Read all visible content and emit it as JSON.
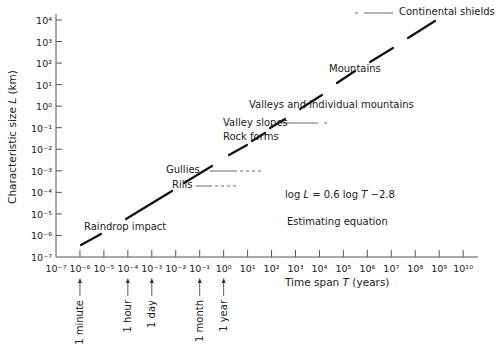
{
  "chart_data": {
    "type": "line",
    "title": "",
    "xlabel": "Time span T (years)",
    "ylabel": "Characteristic size L (km)",
    "xscale": "log",
    "yscale": "log",
    "xlim_exp": [
      -7,
      10
    ],
    "ylim_exp": [
      -7,
      4
    ],
    "x_tick_exponents": [
      -7,
      -6,
      -5,
      -4,
      -3,
      -2,
      -1,
      0,
      1,
      2,
      3,
      4,
      5,
      6,
      7,
      8,
      9,
      10
    ],
    "y_tick_exponents": [
      -7,
      -6,
      -5,
      -4,
      -3,
      -2,
      -1,
      0,
      1,
      2,
      3,
      4
    ],
    "equation": "log L = 0.6 log T −2.8",
    "equation_caption": "Estimating equation",
    "series": [
      {
        "name": "Estimating line (dashed segments)",
        "x_log": [
          -6,
          9.5
        ],
        "y_log": [
          -6.4,
          2.9
        ]
      }
    ],
    "landforms": [
      {
        "label": "Raindrop impact",
        "logT": -5.5,
        "logL": -6.1
      },
      {
        "label": "Rills",
        "logT": -0.5,
        "logL": -3.3
      },
      {
        "label": "Gullies",
        "logT": -0.3,
        "logL": -2.9
      },
      {
        "label": "Rock forms",
        "logT": 2.2,
        "logL": -1.4
      },
      {
        "label": "Valley slopes",
        "logT": 3.3,
        "logL": -0.8
      },
      {
        "label": "Valleys and individual mountains",
        "logT": 4.2,
        "logL": 0.2
      },
      {
        "label": "Mountains",
        "logT": 6.5,
        "logL": 1.6
      },
      {
        "label": "Continental shields",
        "logT": 8.3,
        "logL": 2.9
      }
    ],
    "time_markers": [
      {
        "label": "1 minute",
        "logT": -6
      },
      {
        "label": "1 hour",
        "logT": -4
      },
      {
        "label": "1 day",
        "logT": -3
      },
      {
        "label": "1 month",
        "logT": -1
      },
      {
        "label": "1 year",
        "logT": 0
      }
    ],
    "grid": false,
    "legend": "none"
  },
  "labels": {
    "ylabel_prefix": "Characteristic size ",
    "ylabel_var": "L",
    "ylabel_suffix": " (km)",
    "xlabel_prefix": "Time span ",
    "xlabel_var": "T",
    "xlabel_suffix": " (years)",
    "eq_a": "log ",
    "eq_L": "L",
    "eq_b": " = 0.6 log ",
    "eq_T": "T",
    "eq_c": " −2.8",
    "eq_caption": "Estimating equation",
    "raindrop": "Raindrop impact",
    "rills": "Rills",
    "gullies": "Gullies",
    "rock_forms": "Rock forms",
    "valley_slopes": "Valley slopes",
    "valleys": "Valleys and individual mountains",
    "mountains": "Mountains",
    "continental": "Continental shields",
    "minute": "1 minute",
    "hour": "1 hour",
    "day": "1 day",
    "month": "1 month",
    "year": "1 year"
  },
  "colors": {
    "ink": "#222222",
    "axis": "#555555"
  }
}
